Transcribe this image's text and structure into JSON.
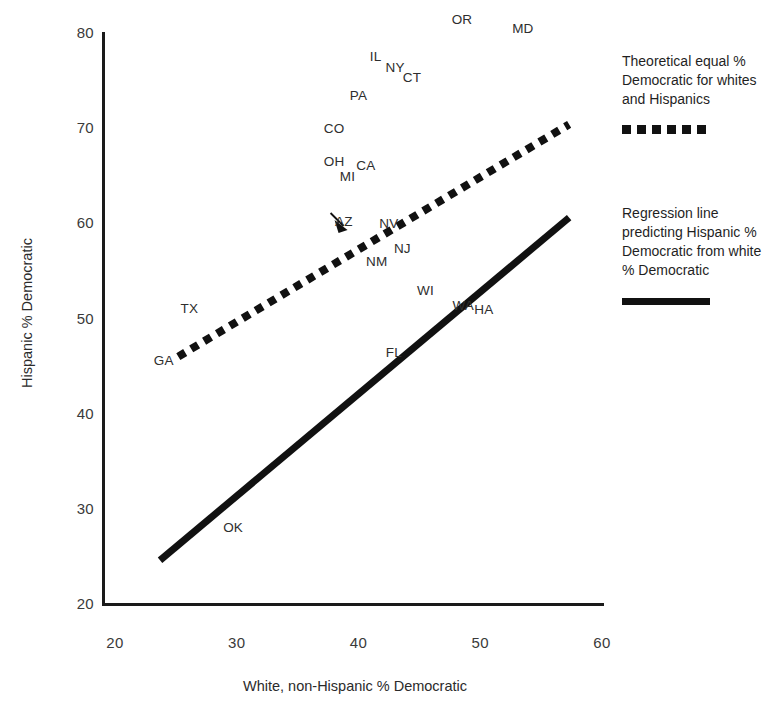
{
  "chart_data": {
    "type": "scatter",
    "title": "",
    "xlabel": "White, non-Hispanic % Democratic",
    "ylabel": "Hispanic % Democratic",
    "xlim": [
      20,
      60
    ],
    "ylim": [
      20,
      80
    ],
    "xticks": [
      "20",
      "30",
      "40",
      "50",
      "60"
    ],
    "yticks": [
      "20",
      "30",
      "40",
      "50",
      "60",
      "70",
      "80"
    ],
    "grid": false,
    "legend_position": "right",
    "point_style": "text-labels-only",
    "points": [
      {
        "label": "OR",
        "x": 48.5,
        "y": 81.5
      },
      {
        "label": "MD",
        "x": 53.5,
        "y": 80.5
      },
      {
        "label": "IL",
        "x": 41.4,
        "y": 77.6
      },
      {
        "label": "NY",
        "x": 43.0,
        "y": 76.4
      },
      {
        "label": "CT",
        "x": 44.4,
        "y": 75.4
      },
      {
        "label": "PA",
        "x": 40.0,
        "y": 73.5
      },
      {
        "label": "CO",
        "x": 38.0,
        "y": 70.0
      },
      {
        "label": "OH",
        "x": 38.0,
        "y": 66.5
      },
      {
        "label": "CA",
        "x": 40.6,
        "y": 66.1
      },
      {
        "label": "MI",
        "x": 39.1,
        "y": 65.0
      },
      {
        "label": "AZ",
        "x": 38.8,
        "y": 60.2
      },
      {
        "label": "NV",
        "x": 42.5,
        "y": 60.0
      },
      {
        "label": "NJ",
        "x": 43.6,
        "y": 57.4
      },
      {
        "label": "NM",
        "x": 41.5,
        "y": 56.0
      },
      {
        "label": "WI",
        "x": 45.5,
        "y": 53.0
      },
      {
        "label": "TX",
        "x": 26.1,
        "y": 51.1
      },
      {
        "label": "WA",
        "x": 48.6,
        "y": 51.4
      },
      {
        "label": "HA",
        "x": 50.3,
        "y": 51.0
      },
      {
        "label": "FL",
        "x": 42.9,
        "y": 46.5
      },
      {
        "label": "GA",
        "x": 24.0,
        "y": 45.6
      },
      {
        "label": "OK",
        "x": 29.7,
        "y": 28.1
      }
    ],
    "lines": [
      {
        "name": "Theoretical equal % Democratic for whites and Hispanics",
        "style": "dotted",
        "x0": 25.2,
        "y0": 46.0,
        "x1": 57.3,
        "y1": 70.4
      },
      {
        "name": "Regression line predicting Hispanic % Democratic from white % Democratic",
        "style": "solid",
        "x0": 23.7,
        "y0": 24.6,
        "x1": 57.3,
        "y1": 60.6
      }
    ],
    "annotations": [
      {
        "name": "AZ pointer arrow",
        "from_label": "AZ",
        "tip_x": 39.1,
        "tip_y": 59.3
      }
    ]
  },
  "legend": {
    "entries": [
      {
        "id": "theoretical",
        "text": "Theoretical equal % Democratic for whites and Hispanics",
        "swatch": "dotted-line-swatch"
      },
      {
        "id": "regression",
        "text": "Regression line predicting Hispanic % Democratic from white % Democratic",
        "swatch": "solid-line-swatch"
      }
    ]
  },
  "colors": {
    "ink": "#111111",
    "axis": "#1a1a1a",
    "label_text": "#2e2e2e",
    "background": "#ffffff"
  }
}
